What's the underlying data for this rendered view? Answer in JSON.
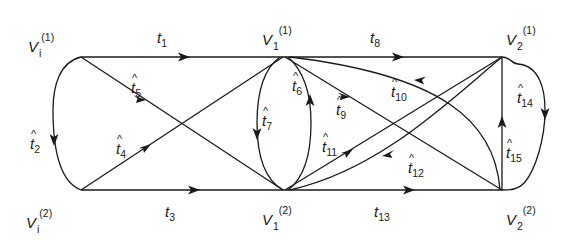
{
  "diagram": {
    "type": "directed-graph",
    "nodes": [
      {
        "id": "Vi1",
        "base": "V",
        "sub": "i",
        "sup": "(1)"
      },
      {
        "id": "Vi2",
        "base": "V",
        "sub": "i",
        "sup": "(2)"
      },
      {
        "id": "V11",
        "base": "V",
        "sub": "1",
        "sup": "(1)"
      },
      {
        "id": "V12",
        "base": "V",
        "sub": "1",
        "sup": "(2)"
      },
      {
        "id": "V21",
        "base": "V",
        "sub": "2",
        "sup": "(1)"
      },
      {
        "id": "V22",
        "base": "V",
        "sub": "2",
        "sup": "(2)"
      }
    ],
    "edges": [
      {
        "id": "t1",
        "base": "t",
        "sub": "1",
        "hat": false,
        "from": "Vi1",
        "to": "V11"
      },
      {
        "id": "t2",
        "base": "t",
        "sub": "2",
        "hat": true,
        "from": "Vi1",
        "to": "Vi2"
      },
      {
        "id": "t3",
        "base": "t",
        "sub": "3",
        "hat": false,
        "from": "Vi2",
        "to": "V12"
      },
      {
        "id": "t4",
        "base": "t",
        "sub": "4",
        "hat": true,
        "from": "Vi2",
        "to": "V11"
      },
      {
        "id": "t5",
        "base": "t",
        "sub": "5",
        "hat": true,
        "from": "Vi1",
        "to": "V12"
      },
      {
        "id": "t6",
        "base": "t",
        "sub": "6",
        "hat": true,
        "from": "V12",
        "to": "V11"
      },
      {
        "id": "t7",
        "base": "t",
        "sub": "7",
        "hat": true,
        "from": "V11",
        "to": "V12"
      },
      {
        "id": "t8",
        "base": "t",
        "sub": "8",
        "hat": false,
        "from": "V11",
        "to": "V21"
      },
      {
        "id": "t9",
        "base": "t",
        "sub": "9",
        "hat": true,
        "from": "V11",
        "to": "V22"
      },
      {
        "id": "t10",
        "base": "t",
        "sub": "10",
        "hat": true,
        "from": "V22",
        "to": "V11"
      },
      {
        "id": "t11",
        "base": "t",
        "sub": "11",
        "hat": true,
        "from": "V12",
        "to": "V21"
      },
      {
        "id": "t12",
        "base": "t",
        "sub": "12",
        "hat": true,
        "from": "V21",
        "to": "V12"
      },
      {
        "id": "t13",
        "base": "t",
        "sub": "13",
        "hat": false,
        "from": "V12",
        "to": "V22"
      },
      {
        "id": "t14",
        "base": "t",
        "sub": "14",
        "hat": true,
        "from": "V21",
        "to": "V22"
      },
      {
        "id": "t15",
        "base": "t",
        "sub": "15",
        "hat": true,
        "from": "V22",
        "to": "V21"
      }
    ],
    "hat_glyph": "^"
  }
}
